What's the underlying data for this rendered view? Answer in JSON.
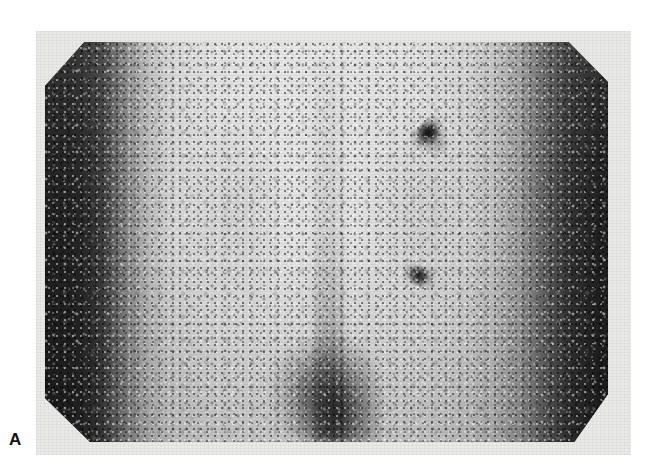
{
  "figure": {
    "panel_label": "A",
    "modality_name": "scintigraphy-scan",
    "caption": "",
    "background_color": "#ffffff",
    "panel_color": "#e9e9e7",
    "field_border_color": "#1f1f1f",
    "field_center_color": "#e2e2e2"
  },
  "scan": {
    "field_shape": "octagon",
    "field_name": "gamma-camera-field-of-view",
    "orientation": "posterior",
    "regions": [
      {
        "name": "left-flank-attenuation",
        "tone": "dark"
      },
      {
        "name": "right-flank-attenuation",
        "tone": "dark"
      },
      {
        "name": "central-body-field",
        "tone": "bright"
      },
      {
        "name": "vertebral-midline",
        "tone": "faint-dark"
      },
      {
        "name": "lower-central-uptake",
        "tone": "intense-dark"
      }
    ],
    "focal_findings": [
      {
        "name": "focal-spot-upper",
        "x": 428,
        "y": 133,
        "intensity": "marked"
      },
      {
        "name": "focal-spot-lower",
        "x": 420,
        "y": 277,
        "intensity": "moderate"
      }
    ]
  },
  "chart_data": {
    "type": "heatmap",
    "title": "",
    "xlabel": "",
    "ylabel": "",
    "colormap": "grayscale-inverted",
    "value_label": "counts",
    "legend": "none",
    "grid": false,
    "field_bounds_px": {
      "x0": 45,
      "y0": 42,
      "x1": 608,
      "y1": 442
    },
    "panel_bounds_px": {
      "x0": 36,
      "y0": 31,
      "x1": 631,
      "y1": 455
    },
    "profiles": {
      "horizontal_profile_name": "left-right count profile",
      "horizontal_x_fraction": [
        0.0,
        0.06,
        0.1,
        0.13,
        0.16,
        0.19,
        0.23,
        0.3,
        0.42,
        0.55,
        0.66,
        0.74,
        0.8,
        0.85,
        0.89,
        0.93,
        0.97,
        1.0
      ],
      "horizontal_gray_value": [
        31,
        36,
        58,
        110,
        157,
        192,
        212,
        222,
        226,
        225,
        220,
        210,
        189,
        147,
        94,
        52,
        36,
        31
      ],
      "vertical_profile_name": "top-bottom count profile",
      "vertical_y_fraction": [
        0.0,
        0.12,
        0.3,
        0.48,
        0.68,
        0.84,
        1.0
      ],
      "vertical_brightness_delta": [
        10,
        6,
        2,
        0,
        -5,
        -10,
        -14
      ]
    },
    "hotspots": [
      {
        "label": "focal-spot-upper",
        "x_fraction": 0.68,
        "y_fraction": 0.23,
        "relative_intensity": 0.92
      },
      {
        "label": "focal-spot-lower",
        "x_fraction": 0.67,
        "y_fraction": 0.59,
        "relative_intensity": 0.8
      },
      {
        "label": "lower-central-uptake",
        "x_fraction": 0.52,
        "y_fraction": 0.92,
        "relative_intensity": 0.7
      }
    ]
  }
}
